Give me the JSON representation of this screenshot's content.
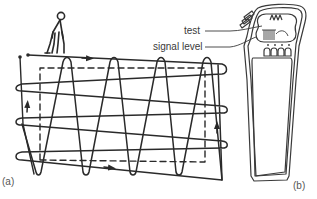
{
  "figure": {
    "panel_a": {
      "label": "(a)",
      "description": "Sweep search pattern: operator walks a zig-zag (sine) path and a cross-wise loop path over a rectangular area, dashed boundary rectangle inside"
    },
    "panel_b": {
      "label": "(b)",
      "callouts": [
        {
          "id": "test",
          "text": "test"
        },
        {
          "id": "signal_level",
          "text": "signal level"
        }
      ],
      "description": "Handheld locator device with test button and signal level indicator lights"
    },
    "colors": {
      "ink": "#2a2a2a",
      "text": "#3a3a3a",
      "background": "#ffffff"
    }
  }
}
